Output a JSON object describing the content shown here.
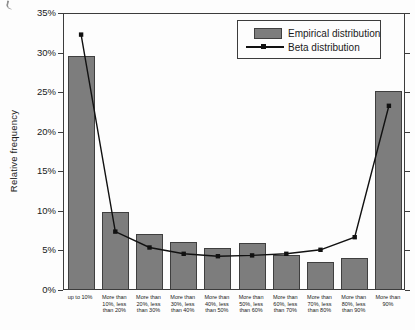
{
  "figure": {
    "background": "#fdfdfd",
    "width_px": 415,
    "height_px": 330
  },
  "chart_data": {
    "type": "bar",
    "title": "",
    "xlabel": "",
    "ylabel": "Relative frequency",
    "ylim": [
      0,
      35
    ],
    "ytick_step": 5,
    "ytick_labels": [
      "0%",
      "5%",
      "10%",
      "15%",
      "20%",
      "25%",
      "30%",
      "35%"
    ],
    "grid": false,
    "legend_position": "top-right",
    "categories": [
      "up to 10%",
      "More than 10%, less than 20%",
      "More than 20%, less than 30%",
      "More than 30%, less than 40%",
      "More than 40%, less than 50%",
      "More than 50%, less than 60%",
      "More than 60%, less than 70%",
      "More than 70%, less than 80%",
      "More than 80%, less than 90%",
      "More than 90%"
    ],
    "category_label_lines": [
      [
        "up to 10%"
      ],
      [
        "More than",
        "10%, less",
        "than 20%"
      ],
      [
        "More than",
        "20%, less",
        "than 30%"
      ],
      [
        "More than",
        "30%, less",
        "than 40%"
      ],
      [
        "More than",
        "40%, less",
        "than 50%"
      ],
      [
        "More than",
        "50%, less",
        "than 60%"
      ],
      [
        "More than",
        "60%, less",
        "than 70%"
      ],
      [
        "More than",
        "70%, less",
        "than 80%"
      ],
      [
        "More than",
        "80%, less",
        "than 90%"
      ],
      [
        "More than",
        "90%"
      ]
    ],
    "series": [
      {
        "name": "Empirical distribution",
        "type": "bar",
        "values": [
          29.4,
          9.7,
          6.9,
          6.0,
          5.2,
          5.8,
          4.3,
          3.4,
          3.9,
          25.0
        ]
      },
      {
        "name": "Beta distribution",
        "type": "line",
        "values": [
          32.4,
          7.5,
          5.5,
          4.7,
          4.4,
          4.5,
          4.7,
          5.2,
          6.8,
          23.4
        ]
      }
    ],
    "colors": {
      "bar_fill": "#7d7d7d",
      "bar_border": "#3f3f3f",
      "line": "#111111",
      "axis": "#3c3c3c",
      "background": "#fdfdfd"
    }
  }
}
